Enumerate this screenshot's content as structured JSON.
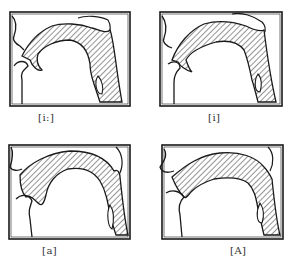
{
  "figure": {
    "type": "articulatory vocal tract diagrams",
    "colors": {
      "ink": "#1a1a1a",
      "hatch": "#2a2a2a",
      "paper": "#ffffff"
    },
    "panels": [
      {
        "id": "panel-1",
        "label": "[i:]",
        "position": "top-left"
      },
      {
        "id": "panel-2",
        "label": "[i]",
        "position": "top-right"
      },
      {
        "id": "panel-3",
        "label": "[a]",
        "position": "bottom-left"
      },
      {
        "id": "panel-4",
        "label": "[A]",
        "position": "bottom-right"
      }
    ]
  }
}
